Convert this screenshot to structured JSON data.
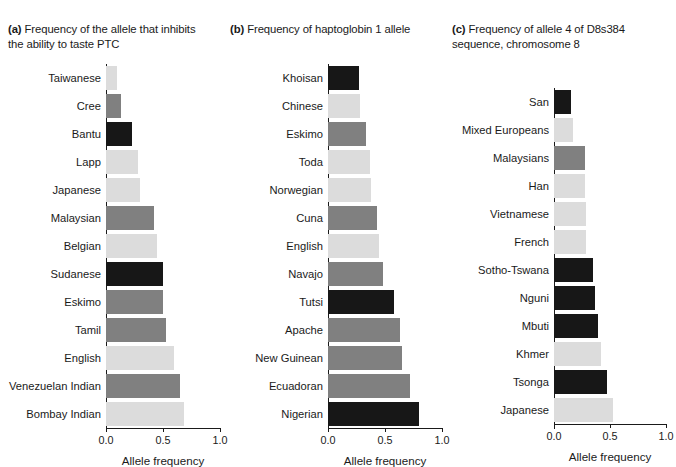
{
  "figure": {
    "axis_title": "Allele frequency",
    "tick_labels": [
      "0.0",
      "0.5",
      "1.0"
    ],
    "colors": {
      "dark": "#171717",
      "mid": "#808080",
      "light": "#dcdcdc",
      "axis": "#1a1a1a",
      "background": "#ffffff"
    }
  },
  "panels": [
    {
      "key": "a",
      "marker": "(a)",
      "title": "Frequency of the allele that inhibits the ability to taste PTC"
    },
    {
      "key": "b",
      "marker": "(b)",
      "title": "Frequency of haptoglobin 1 allele"
    },
    {
      "key": "c",
      "marker": "(c)",
      "title": "Frequency of allele 4 of D8s384 sequence, chromosome 8"
    }
  ],
  "chart_data": [
    {
      "type": "bar",
      "panel": "a",
      "title": "(a) Frequency of the allele that inhibits the ability to taste PTC",
      "orientation": "horizontal",
      "xlabel": "Allele frequency",
      "ylabel": "",
      "xlim": [
        0.0,
        1.0
      ],
      "xticks": [
        0.0,
        0.5,
        1.0
      ],
      "grid": false,
      "legend": "none",
      "categories": [
        "Taiwanese",
        "Cree",
        "Bantu",
        "Lapp",
        "Japanese",
        "Malaysian",
        "Belgian",
        "Sudanese",
        "Eskimo",
        "Tamil",
        "English",
        "Venezuelan Indian",
        "Bombay Indian"
      ],
      "values": [
        0.1,
        0.13,
        0.23,
        0.28,
        0.3,
        0.42,
        0.45,
        0.5,
        0.5,
        0.53,
        0.6,
        0.65,
        0.68
      ],
      "shades": [
        "light",
        "mid",
        "dark",
        "light",
        "light",
        "mid",
        "light",
        "dark",
        "mid",
        "mid",
        "light",
        "mid",
        "light"
      ]
    },
    {
      "type": "bar",
      "panel": "b",
      "title": "(b) Frequency of haptoglobin 1 allele",
      "orientation": "horizontal",
      "xlabel": "Allele frequency",
      "ylabel": "",
      "xlim": [
        0.0,
        1.0
      ],
      "xticks": [
        0.0,
        0.5,
        1.0
      ],
      "grid": false,
      "legend": "none",
      "categories": [
        "Khoisan",
        "Chinese",
        "Eskimo",
        "Toda",
        "Norwegian",
        "Cuna",
        "English",
        "Navajo",
        "Tutsi",
        "Apache",
        "New Guinean",
        "Ecuadoran",
        "Nigerian"
      ],
      "values": [
        0.27,
        0.28,
        0.33,
        0.37,
        0.38,
        0.43,
        0.45,
        0.48,
        0.58,
        0.63,
        0.65,
        0.72,
        0.8
      ],
      "shades": [
        "dark",
        "light",
        "mid",
        "light",
        "light",
        "mid",
        "light",
        "mid",
        "dark",
        "mid",
        "mid",
        "mid",
        "dark"
      ]
    },
    {
      "type": "bar",
      "panel": "c",
      "title": "(c) Frequency of allele 4 of D8s384 sequence, chromosome 8",
      "orientation": "horizontal",
      "xlabel": "Allele frequency",
      "ylabel": "",
      "xlim": [
        0.0,
        1.0
      ],
      "xticks": [
        0.0,
        0.5,
        1.0
      ],
      "grid": false,
      "legend": "none",
      "categories": [
        "San",
        "Mixed Europeans",
        "Malaysians",
        "Han",
        "Vietnamese",
        "French",
        "Sotho-Tswana",
        "Nguni",
        "Mbuti",
        "Khmer",
        "Tsonga",
        "Japanese"
      ],
      "values": [
        0.15,
        0.17,
        0.28,
        0.28,
        0.29,
        0.29,
        0.35,
        0.37,
        0.39,
        0.42,
        0.47,
        0.53
      ],
      "shades": [
        "dark",
        "light",
        "mid",
        "light",
        "light",
        "light",
        "dark",
        "dark",
        "dark",
        "light",
        "dark",
        "light"
      ]
    }
  ]
}
